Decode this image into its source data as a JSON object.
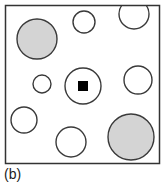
{
  "figure": {
    "caption": "(b)",
    "box": {
      "x": 5.5,
      "y": 5.5,
      "w": 154,
      "h": 158,
      "stroke": "#333333"
    },
    "colors": {
      "stroke": "#3a3a3a",
      "open_fill": "#ffffff",
      "shaded_fill": "#d4d4d4",
      "marker": "#000000"
    },
    "circles": [
      {
        "id": "top-left-shaded",
        "cx": 37,
        "cy": 39,
        "r": 20,
        "shaded": true
      },
      {
        "id": "top-middle-small",
        "cx": 84,
        "cy": 22,
        "r": 11,
        "shaded": false
      },
      {
        "id": "top-right-clipped",
        "cx": 134,
        "cy": 14,
        "r": 15,
        "shaded": false
      },
      {
        "id": "middle-left-small",
        "cx": 42,
        "cy": 84,
        "r": 9,
        "shaded": false
      },
      {
        "id": "center-with-marker",
        "cx": 83,
        "cy": 86,
        "r": 18,
        "shaded": false
      },
      {
        "id": "middle-right",
        "cx": 138,
        "cy": 80,
        "r": 14,
        "shaded": false
      },
      {
        "id": "bottom-left",
        "cx": 24,
        "cy": 120,
        "r": 13,
        "shaded": false
      },
      {
        "id": "bottom-middle",
        "cx": 71,
        "cy": 142,
        "r": 15,
        "shaded": false
      },
      {
        "id": "bottom-right-shaded",
        "cx": 131,
        "cy": 137,
        "r": 23,
        "shaded": true
      }
    ],
    "marker": {
      "shape": "square",
      "x": 78,
      "y": 81,
      "size": 10
    }
  }
}
